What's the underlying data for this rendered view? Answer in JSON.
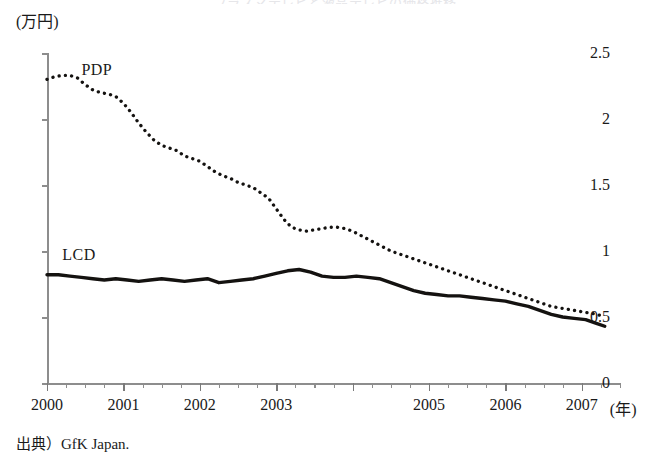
{
  "figure": {
    "clipped_title": "プラズマテレビと液晶テレビの価格推移",
    "unit_label": "(万円)",
    "source_note": "出典）GfK Japan.",
    "year_unit": "(年)"
  },
  "chart_data": {
    "type": "line",
    "title": "",
    "xlabel": "(年)",
    "ylabel": "(万円)",
    "xlim": [
      2000,
      2007.5
    ],
    "ylim": [
      0,
      2.5
    ],
    "grid": false,
    "legend": "inline-annotations",
    "yticks": [
      "0",
      "0.5",
      "1",
      "1.5",
      "2",
      "2.5"
    ],
    "ytick_values": [
      0,
      0.5,
      1,
      1.5,
      2,
      2.5
    ],
    "xtick_labels": [
      "2000",
      "2001",
      "2002",
      "2003",
      "2005",
      "2006",
      "2007"
    ],
    "xtick_label_values": [
      2000,
      2001,
      2002,
      2003,
      2005,
      2006,
      2007
    ],
    "xtick_minor_interval_years": 0.25,
    "annotations": [
      {
        "text": "PDP",
        "x": 2000.45,
        "y": 2.44
      },
      {
        "text": "LCD",
        "x": 2000.2,
        "y": 1.04
      }
    ],
    "series": [
      {
        "name": "PDP",
        "style": "dotted",
        "color": "#141210",
        "x": [
          2000.0,
          2000.1,
          2000.2,
          2000.3,
          2000.4,
          2000.5,
          2000.6,
          2000.7,
          2000.8,
          2000.9,
          2001.0,
          2001.1,
          2001.2,
          2001.3,
          2001.4,
          2001.5,
          2001.6,
          2001.7,
          2001.8,
          2001.9,
          2002.0,
          2002.1,
          2002.2,
          2002.3,
          2002.4,
          2002.5,
          2002.6,
          2002.7,
          2002.8,
          2002.9,
          2003.0,
          2003.1,
          2003.2,
          2003.3,
          2003.4,
          2003.5,
          2003.6,
          2003.7,
          2003.8,
          2003.9,
          2004.0,
          2004.1,
          2004.2,
          2004.3,
          2004.4,
          2004.5,
          2004.6,
          2004.7,
          2004.8,
          2004.9,
          2005.0,
          2005.1,
          2005.2,
          2005.3,
          2005.4,
          2005.5,
          2005.6,
          2005.7,
          2005.8,
          2005.9,
          2006.0,
          2006.1,
          2006.2,
          2006.3,
          2006.4,
          2006.5,
          2006.6,
          2006.7,
          2006.8,
          2006.9,
          2007.0,
          2007.1,
          2007.2,
          2007.3
        ],
        "values": [
          2.3,
          2.32,
          2.33,
          2.33,
          2.31,
          2.26,
          2.22,
          2.2,
          2.19,
          2.17,
          2.12,
          2.05,
          1.97,
          1.9,
          1.84,
          1.8,
          1.78,
          1.76,
          1.72,
          1.7,
          1.68,
          1.64,
          1.6,
          1.57,
          1.55,
          1.52,
          1.5,
          1.48,
          1.44,
          1.4,
          1.32,
          1.24,
          1.18,
          1.16,
          1.15,
          1.16,
          1.17,
          1.18,
          1.18,
          1.17,
          1.15,
          1.12,
          1.09,
          1.06,
          1.03,
          1.0,
          0.98,
          0.96,
          0.94,
          0.92,
          0.9,
          0.88,
          0.86,
          0.84,
          0.82,
          0.8,
          0.78,
          0.76,
          0.74,
          0.72,
          0.7,
          0.68,
          0.66,
          0.64,
          0.62,
          0.6,
          0.58,
          0.57,
          0.56,
          0.55,
          0.54,
          0.53,
          0.52,
          0.5
        ]
      },
      {
        "name": "LCD",
        "style": "solid",
        "color": "#141210",
        "x": [
          2000.0,
          2000.15,
          2000.3,
          2000.45,
          2000.6,
          2000.75,
          2000.9,
          2001.05,
          2001.2,
          2001.35,
          2001.5,
          2001.65,
          2001.8,
          2001.95,
          2002.1,
          2002.25,
          2002.4,
          2002.55,
          2002.7,
          2002.85,
          2003.0,
          2003.15,
          2003.3,
          2003.45,
          2003.6,
          2003.75,
          2003.9,
          2004.05,
          2004.2,
          2004.35,
          2004.5,
          2004.65,
          2004.8,
          2004.95,
          2005.1,
          2005.25,
          2005.4,
          2005.55,
          2005.7,
          2005.85,
          2006.0,
          2006.15,
          2006.3,
          2006.45,
          2006.6,
          2006.75,
          2006.9,
          2007.05,
          2007.2,
          2007.3
        ],
        "values": [
          0.82,
          0.82,
          0.81,
          0.8,
          0.79,
          0.78,
          0.79,
          0.78,
          0.77,
          0.78,
          0.79,
          0.78,
          0.77,
          0.78,
          0.79,
          0.76,
          0.77,
          0.78,
          0.79,
          0.81,
          0.83,
          0.85,
          0.86,
          0.84,
          0.81,
          0.8,
          0.8,
          0.81,
          0.8,
          0.79,
          0.76,
          0.73,
          0.7,
          0.68,
          0.67,
          0.66,
          0.66,
          0.65,
          0.64,
          0.63,
          0.62,
          0.6,
          0.58,
          0.55,
          0.52,
          0.5,
          0.49,
          0.48,
          0.45,
          0.43
        ]
      }
    ]
  }
}
